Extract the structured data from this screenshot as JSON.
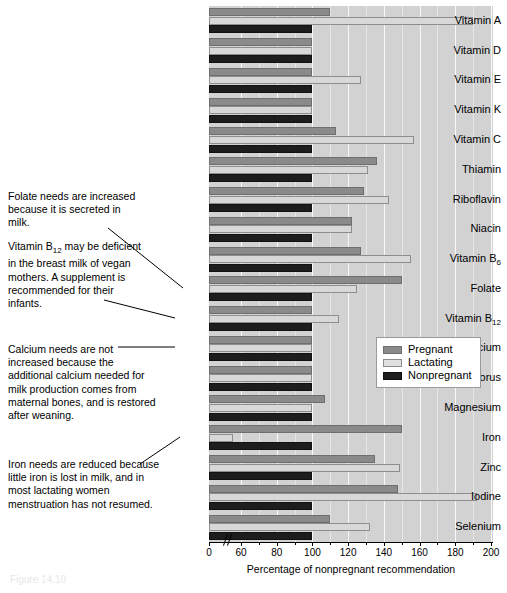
{
  "chart_data": {
    "type": "bar",
    "orientation": "horizontal",
    "title": "",
    "xlabel": "Percentage of nonpregnant recommendation",
    "ylabel": "",
    "xlim": [
      0,
      200
    ],
    "axis_break": "between 0 and 60",
    "grid": true,
    "legend_position": "middle-right inside plot",
    "categories": [
      "Vitamin A",
      "Vitamin D",
      "Vitamin E",
      "Vitamin K",
      "Vitamin C",
      "Thiamin",
      "Riboflavin",
      "Niacin",
      "Vitamin B6",
      "Folate",
      "Vitamin B12",
      "Calcium",
      "Phosphorus",
      "Magnesium",
      "Iron",
      "Zinc",
      "Iodine",
      "Selenium"
    ],
    "series": [
      {
        "name": "Pregnant",
        "color": "#8a8a8a",
        "values": [
          110,
          100,
          100,
          100,
          113,
          136,
          129,
          122,
          127,
          150,
          100,
          100,
          100,
          107,
          150,
          135,
          148,
          110
        ]
      },
      {
        "name": "Lactating",
        "color": "#d8d8d8",
        "values": [
          190,
          100,
          127,
          100,
          157,
          131,
          143,
          122,
          155,
          125,
          115,
          100,
          100,
          100,
          45,
          149,
          192,
          132
        ]
      },
      {
        "name": "Nonpregnant",
        "color": "#1d1d1d",
        "values": [
          100,
          100,
          100,
          100,
          100,
          100,
          100,
          100,
          100,
          100,
          100,
          100,
          100,
          100,
          100,
          100,
          100,
          100
        ]
      }
    ],
    "xticks": [
      0,
      60,
      80,
      100,
      120,
      140,
      160,
      180,
      200
    ],
    "xtick_labels": [
      "0",
      "60",
      "80",
      "100",
      "120",
      "140",
      "160",
      "180",
      "200"
    ]
  },
  "category_labels": [
    {
      "text": "Vitamin A",
      "sub": ""
    },
    {
      "text": "Vitamin D",
      "sub": ""
    },
    {
      "text": "Vitamin E",
      "sub": ""
    },
    {
      "text": "Vitamin K",
      "sub": ""
    },
    {
      "text": "Vitamin C",
      "sub": ""
    },
    {
      "text": "Thiamin",
      "sub": ""
    },
    {
      "text": "Riboflavin",
      "sub": ""
    },
    {
      "text": "Niacin",
      "sub": ""
    },
    {
      "text": "Vitamin B",
      "sub": "6"
    },
    {
      "text": "Folate",
      "sub": ""
    },
    {
      "text": "Vitamin B",
      "sub": "12"
    },
    {
      "text": "Calcium",
      "sub": ""
    },
    {
      "text": "Phosphorus",
      "sub": ""
    },
    {
      "text": "Magnesium",
      "sub": ""
    },
    {
      "text": "Iron",
      "sub": ""
    },
    {
      "text": "Zinc",
      "sub": ""
    },
    {
      "text": "Iodine",
      "sub": ""
    },
    {
      "text": "Selenium",
      "sub": ""
    }
  ],
  "legend": {
    "items": [
      {
        "label": "Pregnant",
        "swatch": "pregnant"
      },
      {
        "label": "Lactating",
        "swatch": "lactating"
      },
      {
        "label": "Nonpregnant",
        "swatch": "nonpregnant"
      }
    ]
  },
  "annotations": {
    "folate": "Folate needs are increased because it is secreted in milk.",
    "b12_pre": "Vitamin B",
    "b12_sub": "12",
    "b12_post": " may be deficient in the breast milk of vegan mothers. A supplement is recommended for their infants.",
    "calcium": "Calcium needs are not increased because the additional calcium needed for milk production comes from maternal bones, and is restored after weaning.",
    "iron": "Iron needs are reduced because little iron is lost in milk, and in most lactating women menstruation has not resumed."
  },
  "axis": {
    "xlabel": "Percentage of nonpregnant recommendation"
  },
  "caption": "Figure 14.10"
}
